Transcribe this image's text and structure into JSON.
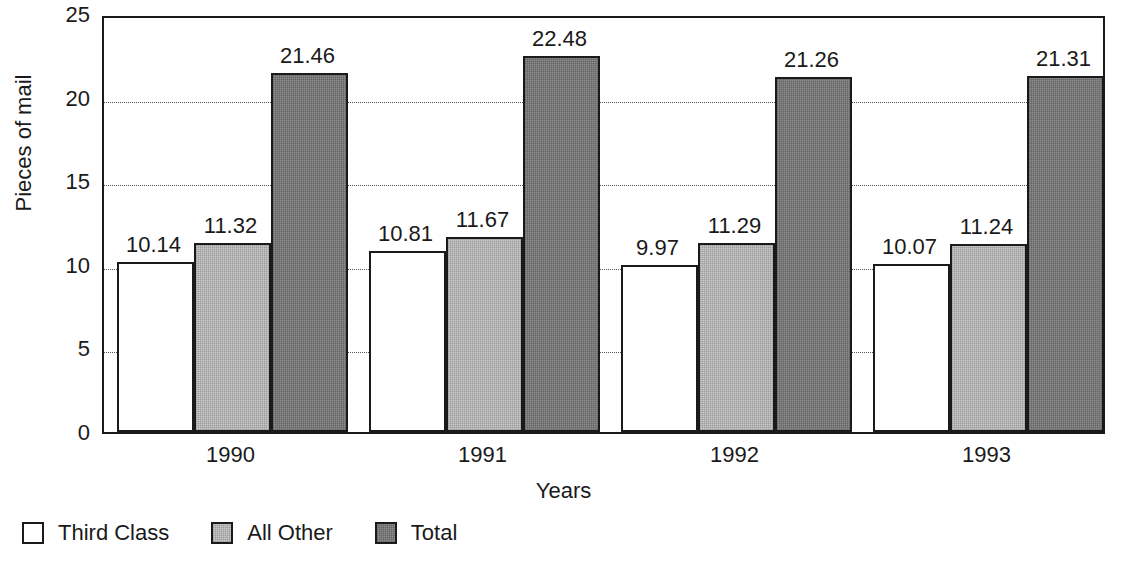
{
  "chart_data": {
    "type": "bar",
    "title": "",
    "subtitle": "",
    "xlabel": "Years",
    "ylabel": "Pieces of mail",
    "categories": [
      "1990",
      "1991",
      "1992",
      "1993"
    ],
    "series": [
      {
        "name": "Third Class",
        "color": "#ffffff",
        "values": [
          10.14,
          10.81,
          9.97,
          10.07
        ]
      },
      {
        "name": "All Other",
        "color": "#c9c9c9",
        "values": [
          11.32,
          11.67,
          11.29,
          11.24
        ]
      },
      {
        "name": "Total",
        "color": "#8d8d8d",
        "values": [
          21.46,
          22.48,
          21.26,
          21.31
        ]
      }
    ],
    "ylim": [
      0,
      25
    ],
    "yticks": [
      0,
      5,
      10,
      15,
      20,
      25
    ],
    "ytick_labels": [
      "0",
      "5",
      "10",
      "15",
      "20",
      "25"
    ],
    "gridlines": {
      "horizontal": true,
      "style": "dotted",
      "at": [
        5,
        10,
        15,
        20
      ]
    },
    "data_labels": [
      [
        "10.14",
        "11.32",
        "21.46"
      ],
      [
        "10.81",
        "11.67",
        "22.48"
      ],
      [
        "9.97",
        "11.29",
        "21.26"
      ],
      [
        "10.07",
        "11.24",
        "21.31"
      ]
    ],
    "legend": {
      "position": "bottom-left",
      "entries": [
        {
          "label": "Third Class",
          "swatch": "white"
        },
        {
          "label": "All Other",
          "swatch": "light-gray"
        },
        {
          "label": "Total",
          "swatch": "dark-gray"
        }
      ]
    },
    "frame": {
      "border": true,
      "color": "#1a1a1a"
    }
  }
}
